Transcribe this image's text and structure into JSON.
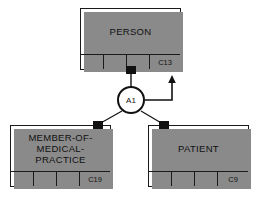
{
  "diagram": {
    "stroke_color": "#111111",
    "shadow_color": "#8a8a8a",
    "background": "#ffffff",
    "entities": [
      {
        "id": "person",
        "name": "PERSON",
        "code": "C13",
        "blank_cells": [
          "",
          "",
          ""
        ],
        "role": "supertype"
      },
      {
        "id": "member-of-medical-practice",
        "name": "MEMBER-OF-\nMEDICAL-\nPRACTICE",
        "code": "C19",
        "blank_cells": [
          "",
          "",
          ""
        ],
        "role": "subtype"
      },
      {
        "id": "patient",
        "name": "PATIENT",
        "code": "C9",
        "blank_cells": [
          "",
          "",
          ""
        ],
        "role": "subtype"
      }
    ],
    "relationship": {
      "id": "a1",
      "label": "A1",
      "shape": "circle"
    },
    "connectors": [
      {
        "name": "person-connector",
        "attached_to": "person"
      },
      {
        "name": "member-connector",
        "attached_to": "member-of-medical-practice"
      },
      {
        "name": "patient-connector",
        "attached_to": "patient"
      }
    ],
    "arrow": {
      "name": "exclusivity-arrow",
      "direction": "right-then-up"
    }
  }
}
